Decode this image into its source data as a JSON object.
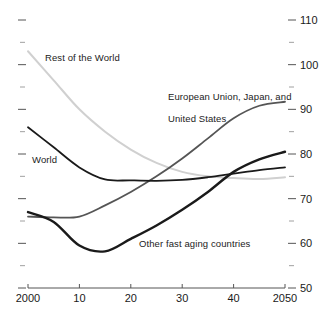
{
  "chart_data": {
    "type": "line",
    "title": "",
    "subtitle": "",
    "xlabel": "",
    "ylabel": "",
    "xlim": [
      2000,
      2050
    ],
    "ylim": [
      50,
      110
    ],
    "grid": false,
    "legend_position": "inline-annotations",
    "x_tick_labels": [
      "2000",
      "10",
      "20",
      "30",
      "40",
      "2050"
    ],
    "x_tick_values": [
      2000,
      2010,
      2020,
      2030,
      2040,
      2050
    ],
    "y_tick_labels": [
      "110",
      "100",
      "90",
      "80",
      "70",
      "60",
      "50"
    ],
    "y_tick_values": [
      110,
      100,
      90,
      80,
      70,
      60,
      50
    ],
    "y_minor_tick_values": [
      105,
      95,
      85,
      75,
      65,
      55
    ],
    "y_axis_side": "right",
    "x": [
      2000,
      2005,
      2010,
      2015,
      2020,
      2025,
      2030,
      2035,
      2040,
      2045,
      2050
    ],
    "series": [
      {
        "name": "Rest of the World",
        "color": "#d0d0d0",
        "width": 2.0,
        "values": [
          103.0,
          96.5,
          90.0,
          85.0,
          81.0,
          78.0,
          76.0,
          75.0,
          74.6,
          74.4,
          74.8
        ]
      },
      {
        "name": "World",
        "color": "#1a1a1a",
        "width": 1.8,
        "values": [
          86.0,
          81.5,
          77.0,
          74.3,
          74.1,
          74.0,
          74.2,
          74.8,
          75.6,
          76.4,
          77.0
        ]
      },
      {
        "name": "European Union, Japan, and\nUnited States",
        "color": "#555555",
        "width": 1.8,
        "values": [
          66.0,
          65.8,
          66.0,
          68.5,
          71.5,
          75.0,
          79.0,
          83.5,
          88.0,
          90.8,
          91.7
        ]
      },
      {
        "name": "Other fast aging countries",
        "color": "#1a1a1a",
        "width": 2.4,
        "values": [
          67.0,
          64.8,
          59.5,
          58.2,
          61.0,
          64.0,
          67.5,
          71.5,
          76.0,
          78.8,
          80.5
        ]
      }
    ],
    "annotations": [
      {
        "text": "Rest of the World",
        "series": "Rest of the World"
      },
      {
        "text": "European Union, Japan, and",
        "series": "European Union, Japan, and United States"
      },
      {
        "text": "United States",
        "series": "European Union, Japan, and United States"
      },
      {
        "text": "World",
        "series": "World"
      },
      {
        "text": "Other fast aging countries",
        "series": "Other fast aging countries"
      }
    ]
  },
  "labels": {
    "rest_of_world": "Rest of the World",
    "eu_line1": "European Union, Japan, and",
    "eu_line2": "United States",
    "world": "World",
    "other_fast_aging": "Other fast aging countries"
  },
  "axis": {
    "x_ticks": [
      "2000",
      "10",
      "20",
      "30",
      "40",
      "2050"
    ],
    "y_ticks": [
      "110",
      "100",
      "90",
      "80",
      "70",
      "60",
      "50"
    ]
  },
  "colors": {
    "rest_of_world": "#d0d0d0",
    "world": "#1a1a1a",
    "eu_japan_us": "#555555",
    "other_fast_aging": "#1a1a1a",
    "axis": "#555555",
    "text": "#1a1a1a",
    "background": "#ffffff"
  }
}
